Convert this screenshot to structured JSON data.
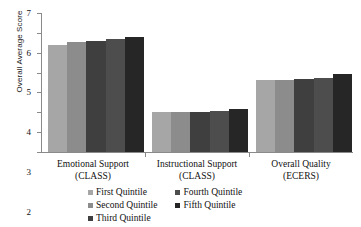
{
  "chart_data": {
    "type": "bar",
    "title": "",
    "xlabel": "",
    "ylabel": "Overall Average Score",
    "ylim": [
      0,
      7
    ],
    "yticks": [
      0,
      1,
      2,
      3,
      4,
      5,
      6,
      7
    ],
    "ytick_labels": [
      "0",
      "1",
      "2",
      "3",
      "4",
      "5",
      "6",
      "7"
    ],
    "grid": false,
    "legend_position": "bottom",
    "categories": [
      "Emotional Support\n(CLASS)",
      "Instructional Support\n(CLASS)",
      "Overall Quality\n(ECERS)"
    ],
    "category_lines": [
      {
        "line1": "Emotional Support",
        "line2": "(CLASS)"
      },
      {
        "line1": "Instructional Support",
        "line2": "(CLASS)"
      },
      {
        "line1": "Overall Quality",
        "line2": "(ECERS)"
      }
    ],
    "series": [
      {
        "name": "First Quintile",
        "color": "#a6a6a6",
        "values": [
          5.4,
          2.0,
          3.65
        ]
      },
      {
        "name": "Second Quintile",
        "color": "#8c8c8c",
        "values": [
          5.55,
          2.0,
          3.65
        ]
      },
      {
        "name": "Third Quintile",
        "color": "#3f3f3f",
        "values": [
          5.6,
          2.0,
          3.7
        ]
      },
      {
        "name": "Fourth Quintile",
        "color": "#4d4d4d",
        "values": [
          5.7,
          2.05,
          3.75
        ]
      },
      {
        "name": "Fifth Quintile",
        "color": "#262626",
        "values": [
          5.8,
          2.15,
          3.95
        ]
      }
    ]
  },
  "legend": {
    "column_one": [
      "First Quintile",
      "Second Quintile",
      "Third Quintile"
    ],
    "column_two": [
      "Fourth Quintile",
      "Fifth Quintile"
    ]
  }
}
